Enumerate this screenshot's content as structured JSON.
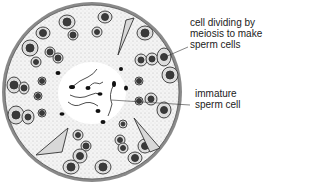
{
  "diagram": {
    "labels": [
      {
        "id": "meiosis",
        "text": "cell dividing by\nmeiosis to make\nsperm cells"
      },
      {
        "id": "immature",
        "text": "immature\nsperm cell"
      }
    ],
    "colors": {
      "outline": "#333333",
      "stipple": "#bdbdbd",
      "nucleus": "#3a3a3a",
      "cell_fill": "#e8e8e8",
      "lumen": "#ffffff"
    }
  }
}
